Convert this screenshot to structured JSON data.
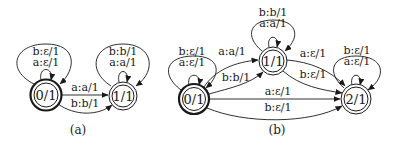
{
  "figure": {
    "panels": [
      {
        "caption": "(a)",
        "states": [
          {
            "id": "a0",
            "label": "0/1",
            "initial": true,
            "final": true
          },
          {
            "id": "a1",
            "label": "1/1",
            "initial": false,
            "final": true
          }
        ],
        "transitions": [
          {
            "from": "a0",
            "to": "a0",
            "labels": [
              "b:ε/1",
              "a:ε/1"
            ],
            "outer": "b:ε/1",
            "inner": "a:ε/1"
          },
          {
            "from": "a1",
            "to": "a1",
            "labels": [
              "b:b/1",
              "a:a/1"
            ],
            "outer": "b:b/1",
            "inner": "a:a/1"
          },
          {
            "from": "a0",
            "to": "a1",
            "label": "a:a/1"
          },
          {
            "from": "a0",
            "to": "a1",
            "label": "b:b/1"
          }
        ]
      },
      {
        "caption": "(b)",
        "states": [
          {
            "id": "b0",
            "label": "0/1",
            "initial": true,
            "final": true
          },
          {
            "id": "b1",
            "label": "1/1",
            "initial": false,
            "final": true
          },
          {
            "id": "b2",
            "label": "2/1",
            "initial": false,
            "final": true
          }
        ],
        "transitions": [
          {
            "from": "b0",
            "to": "b0",
            "outer": "b:ε/1",
            "inner": "a:ε/1"
          },
          {
            "from": "b1",
            "to": "b1",
            "outer": "b:b/1",
            "inner": "a:a/1"
          },
          {
            "from": "b2",
            "to": "b2",
            "outer": "b:ε/1",
            "inner": "a:ε/1"
          },
          {
            "from": "b0",
            "to": "b1",
            "label": "a:a/1"
          },
          {
            "from": "b0",
            "to": "b1",
            "label": "b:b/1"
          },
          {
            "from": "b1",
            "to": "b2",
            "label": "a:ε/1"
          },
          {
            "from": "b1",
            "to": "b2",
            "label": "b:ε/1"
          },
          {
            "from": "b0",
            "to": "b2",
            "label": "a:ε/1"
          },
          {
            "from": "b0",
            "to": "b2",
            "label": "b:ε/1"
          }
        ]
      }
    ]
  },
  "colors": {
    "ink": "#1a1a1a",
    "background": "#ffffff"
  }
}
